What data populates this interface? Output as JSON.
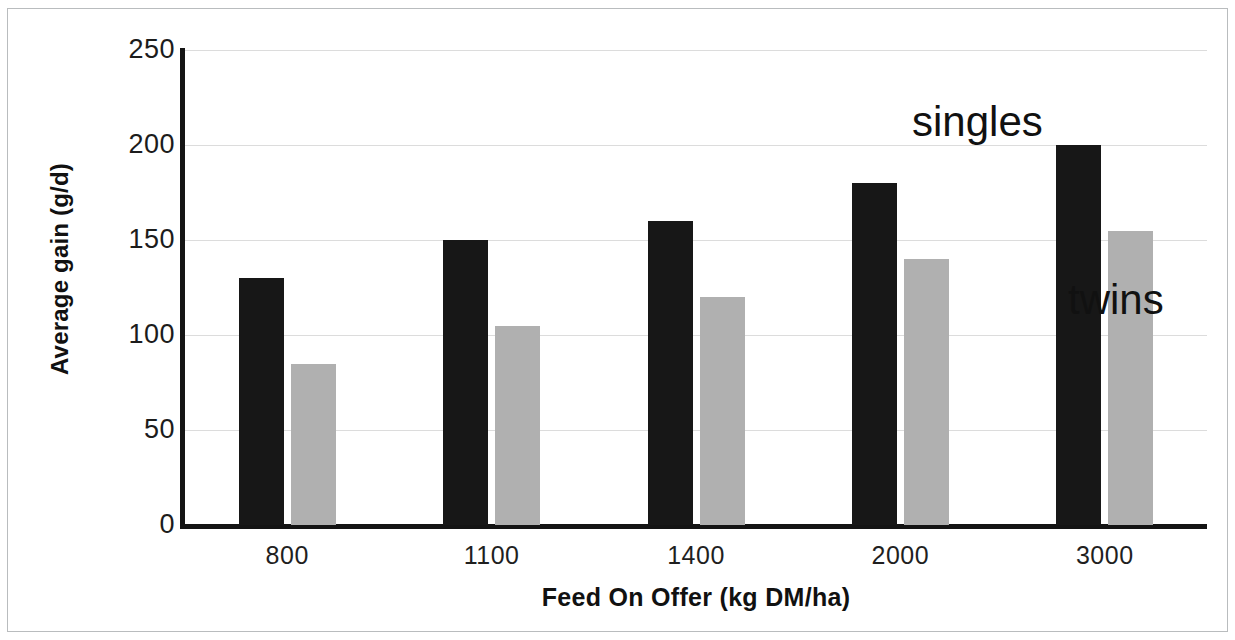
{
  "chart_data": {
    "type": "bar",
    "title": "",
    "subtitle": "",
    "xlabel": "Feed On Offer (kg DM/ha)",
    "ylabel": "Average gain (g/d)",
    "categories": [
      "800",
      "1100",
      "1400",
      "2000",
      "3000"
    ],
    "series": [
      {
        "name": "singles",
        "color": "#171717",
        "values": [
          130,
          150,
          160,
          180,
          200
        ]
      },
      {
        "name": "twins",
        "color": "#b0b0b0",
        "values": [
          85,
          105,
          120,
          140,
          155
        ]
      }
    ],
    "ylim": [
      0,
      250
    ],
    "yticks": [
      "0",
      "50",
      "100",
      "150",
      "200",
      "250"
    ],
    "ytick_values": [
      0,
      50,
      100,
      150,
      200,
      250
    ],
    "grid": "horizontal",
    "legend_position": "inline-annotations",
    "annotations": [
      {
        "text": "singles",
        "refers_to": "singles"
      },
      {
        "text": "twins",
        "refers_to": "twins"
      }
    ],
    "background": "#ffffff",
    "axis_color": "#141414",
    "grid_color": "#dcdcdc"
  }
}
